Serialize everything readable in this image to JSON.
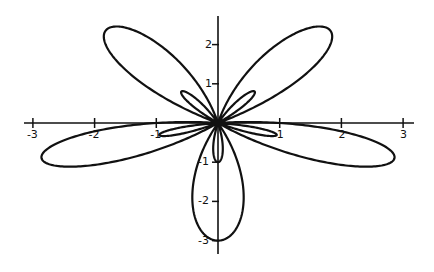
{
  "chart_data": {
    "type": "line",
    "subtype": "polar-rose",
    "title": "",
    "equation": "r = 1 - 2 sin(5θ)",
    "xlabel": "",
    "ylabel": "",
    "xlim": [
      -3.1,
      3.1
    ],
    "ylim": [
      -3.1,
      2.6
    ],
    "x_ticks": [
      -3,
      -2,
      -1,
      1,
      2,
      3
    ],
    "x_tick_labels": [
      "-3",
      "-2",
      "-1",
      "1",
      "2",
      "3"
    ],
    "y_ticks": [
      2,
      1,
      -1,
      -2,
      -3
    ],
    "y_tick_labels": [
      "2",
      "1",
      "-1",
      "-2",
      "-3"
    ],
    "grid": false,
    "legend": null,
    "large_petals": 5,
    "large_petal_length": 3,
    "small_petals": 5,
    "small_petal_length": 1,
    "line_color": "#111111"
  }
}
